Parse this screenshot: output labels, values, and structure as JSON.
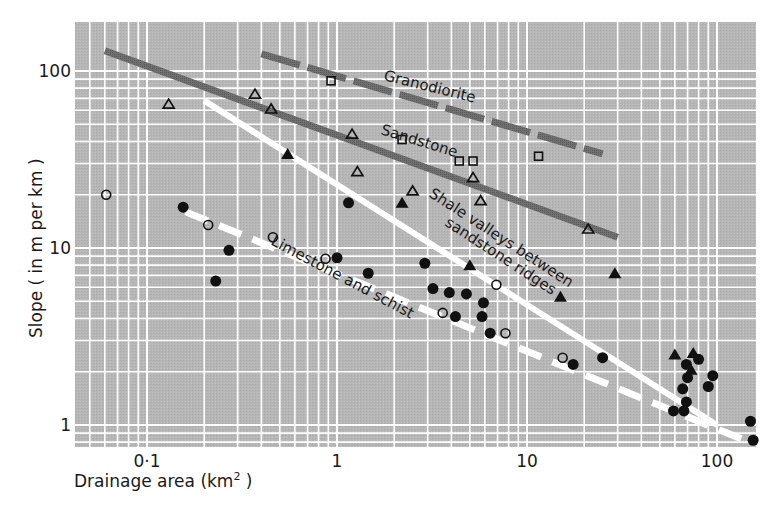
{
  "chart_data": {
    "type": "scatter",
    "title": "",
    "xlabel": "Drainage area (km²)",
    "ylabel": "Slope ( in m per km )",
    "xscale": "log",
    "yscale": "log",
    "xlim": [
      0.042,
      170
    ],
    "ylim": [
      0.75,
      190
    ],
    "grid": true,
    "x_ticks": [
      {
        "value": 0.1,
        "label": "0·1"
      },
      {
        "value": 1,
        "label": "1"
      },
      {
        "value": 10,
        "label": "10"
      },
      {
        "value": 100,
        "label": "100"
      }
    ],
    "y_ticks": [
      {
        "value": 1,
        "label": "1"
      },
      {
        "value": 10,
        "label": "10"
      },
      {
        "value": 100,
        "label": "100"
      }
    ],
    "trend_lines": [
      {
        "name": "Granodiorite",
        "style": "dashed-dark",
        "color": "#6e6e6e",
        "points": [
          [
            0.4,
            125
          ],
          [
            25,
            34
          ]
        ]
      },
      {
        "name": "Sandstone",
        "style": "solid-dark",
        "color": "#6e6e6e",
        "points": [
          [
            0.06,
            130
          ],
          [
            30,
            11.5
          ]
        ]
      },
      {
        "name": "Shale valleys between sandstone ridges",
        "style": "solid-white",
        "color": "#ffffff",
        "points": [
          [
            0.2,
            68
          ],
          [
            100,
            1.0
          ]
        ]
      },
      {
        "name": "Limestone and schist",
        "style": "dashed-white",
        "color": "#ffffff",
        "points": [
          [
            0.16,
            16
          ],
          [
            140,
            0.82
          ]
        ]
      }
    ],
    "series": [
      {
        "name": "Granodiorite",
        "marker": "open-square",
        "points": [
          [
            0.93,
            88
          ],
          [
            2.2,
            41
          ],
          [
            4.4,
            31
          ],
          [
            5.2,
            31
          ],
          [
            11.5,
            33
          ]
        ]
      },
      {
        "name": "Sandstone",
        "marker": "open-triangle",
        "points": [
          [
            0.13,
            65
          ],
          [
            0.37,
            74
          ],
          [
            0.45,
            61
          ],
          [
            1.2,
            44
          ],
          [
            1.28,
            27
          ],
          [
            2.5,
            21
          ],
          [
            5.2,
            25
          ],
          [
            5.7,
            18.5
          ],
          [
            21,
            12.8
          ]
        ]
      },
      {
        "name": "Shale valleys between sandstone ridges",
        "marker": "filled-triangle",
        "points": [
          [
            0.55,
            34
          ],
          [
            2.2,
            18
          ],
          [
            5.0,
            8.0
          ],
          [
            15,
            5.3
          ],
          [
            29,
            7.2
          ],
          [
            60,
            2.5
          ],
          [
            75,
            2.55
          ],
          [
            73,
            2.05
          ]
        ]
      },
      {
        "name": "Limestone and schist (open)",
        "marker": "open-circle",
        "points": [
          [
            0.061,
            20
          ],
          [
            0.21,
            13.5
          ],
          [
            0.46,
            11.5
          ],
          [
            0.87,
            8.7
          ],
          [
            3.6,
            4.3
          ],
          [
            6.9,
            6.2
          ],
          [
            7.7,
            3.3
          ],
          [
            15.4,
            2.4
          ]
        ]
      },
      {
        "name": "Limestone and schist (filled)",
        "marker": "filled-circle",
        "points": [
          [
            0.155,
            17
          ],
          [
            0.27,
            9.7
          ],
          [
            0.23,
            6.5
          ],
          [
            1.15,
            18
          ],
          [
            1.0,
            8.8
          ],
          [
            1.46,
            7.2
          ],
          [
            2.9,
            8.2
          ],
          [
            3.2,
            5.9
          ],
          [
            3.9,
            5.6
          ],
          [
            4.8,
            5.5
          ],
          [
            5.9,
            4.9
          ],
          [
            5.8,
            4.1
          ],
          [
            4.2,
            4.1
          ],
          [
            6.4,
            3.3
          ],
          [
            17.5,
            2.2
          ],
          [
            25,
            2.4
          ],
          [
            69,
            2.2
          ],
          [
            80,
            2.35
          ],
          [
            95,
            1.9
          ],
          [
            70,
            1.85
          ],
          [
            90,
            1.65
          ],
          [
            66,
            1.6
          ],
          [
            69,
            1.35
          ],
          [
            59,
            1.2
          ],
          [
            67,
            1.2
          ],
          [
            150,
            1.05
          ],
          [
            155,
            0.82
          ]
        ]
      }
    ]
  },
  "labels": {
    "granodiorite": "Granodiorite",
    "sandstone": "Sandstone",
    "shale_1": "Shale valleys between",
    "shale_2": "sandstone ridges",
    "limestone": "Limestone and schist",
    "xlabel_main": "Drainage area (km",
    "xlabel_sup": "2",
    "xlabel_close": " )",
    "ylabel": "Slope ( in m per km )"
  },
  "colors": {
    "plot_background": "#b4b4b4",
    "gridline": "#ffffff",
    "dark_line": "#6e6e6e",
    "marker": "#111111"
  }
}
